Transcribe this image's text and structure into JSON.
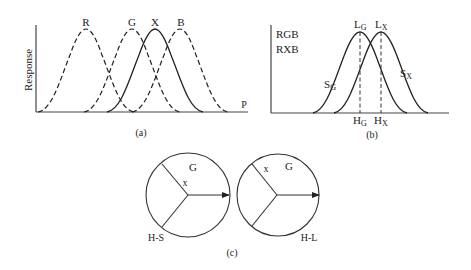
{
  "panel_a": {
    "caption": "(a)",
    "y_label": "Response",
    "x_label": "P",
    "curves": [
      {
        "label": "R",
        "style": "dashed",
        "peak_x": 86
      },
      {
        "label": "G",
        "style": "dashed",
        "peak_x": 132
      },
      {
        "label": "X",
        "style": "solid",
        "peak_x": 155
      },
      {
        "label": "B",
        "style": "dashed",
        "peak_x": 180
      }
    ]
  },
  "panel_b": {
    "caption": "(b)",
    "legend_line1": "RGB",
    "legend_line2": "RXB",
    "left_curve": {
      "slope_label": "S",
      "slope_sub": "G",
      "peak_label": "L",
      "peak_sub": "G",
      "hue_label": "H",
      "hue_sub": "G"
    },
    "right_curve": {
      "slope_label": "S",
      "slope_sub": "X",
      "peak_label": "L",
      "peak_sub": "X",
      "hue_label": "H",
      "hue_sub": "X"
    }
  },
  "panel_c": {
    "caption": "(c)",
    "left_wheel": {
      "sector_label": "G",
      "point_label": "x",
      "mode_label": "H-S"
    },
    "right_wheel": {
      "sector_label": "G",
      "point_label": "x",
      "mode_label": "H-L"
    }
  }
}
